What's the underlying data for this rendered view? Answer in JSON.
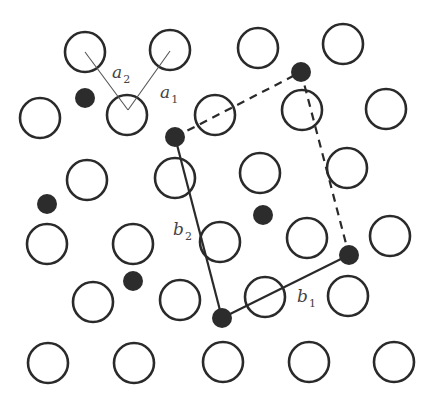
{
  "figure": {
    "colors": {
      "stroke": "#2a2a2a",
      "fill_dot": "#2c2c2c",
      "thin_line": "#555555",
      "label": "#444444",
      "background": "#ffffff"
    },
    "substrate_atoms": {
      "radius": 20,
      "points": [
        [
          85,
          52
        ],
        [
          170,
          50
        ],
        [
          258,
          48
        ],
        [
          343,
          44
        ],
        [
          40,
          118
        ],
        [
          127,
          115
        ],
        [
          215,
          115
        ],
        [
          302,
          110
        ],
        [
          386,
          109
        ],
        [
          87,
          180
        ],
        [
          175,
          178
        ],
        [
          260,
          173
        ],
        [
          347,
          168
        ],
        [
          47,
          244
        ],
        [
          133,
          244
        ],
        [
          220,
          242
        ],
        [
          307,
          238
        ],
        [
          390,
          236
        ],
        [
          93,
          302
        ],
        [
          180,
          300
        ],
        [
          265,
          297
        ],
        [
          348,
          296
        ],
        [
          48,
          363
        ],
        [
          134,
          363
        ],
        [
          223,
          362
        ],
        [
          309,
          362
        ],
        [
          394,
          362
        ]
      ]
    },
    "adsorbate_atoms": {
      "radius": 10,
      "points": [
        [
          85,
          98
        ],
        [
          175,
          137
        ],
        [
          301,
          72
        ],
        [
          47,
          204
        ],
        [
          263,
          215
        ],
        [
          133,
          281
        ],
        [
          349,
          255
        ],
        [
          222,
          318
        ]
      ]
    },
    "vectors": {
      "a1": {
        "label": "a",
        "sub": "1",
        "from": [
          128,
          110
        ],
        "to": [
          170,
          51
        ],
        "label_pos": [
          160,
          98
        ]
      },
      "a2": {
        "label": "a",
        "sub": "2",
        "from": [
          128,
          110
        ],
        "to": [
          85,
          52
        ],
        "label_pos": [
          112,
          78
        ]
      },
      "b1": {
        "label": "b",
        "sub": "1",
        "from": [
          222,
          318
        ],
        "to": [
          349,
          255
        ],
        "label_pos": [
          297,
          302
        ]
      },
      "b2": {
        "label": "b",
        "sub": "2",
        "from": [
          175,
          137
        ],
        "to": [
          222,
          318
        ],
        "label_pos": [
          173,
          235
        ]
      }
    },
    "cell_dashed_edges": [
      {
        "from": [
          175,
          137
        ],
        "to": [
          301,
          72
        ]
      },
      {
        "from": [
          301,
          72
        ],
        "to": [
          349,
          255
        ]
      }
    ]
  }
}
